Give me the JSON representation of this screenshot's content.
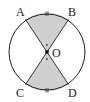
{
  "diagram": {
    "type": "circle-geometry",
    "center": {
      "label": "O"
    },
    "points": [
      {
        "label": "A",
        "position": "upper-left"
      },
      {
        "label": "B",
        "position": "upper-right"
      },
      {
        "label": "C",
        "position": "lower-left"
      },
      {
        "label": "D",
        "position": "lower-right"
      }
    ],
    "segments": [
      "AD",
      "BC"
    ],
    "shaded_sectors": [
      "AOB",
      "COD"
    ],
    "equal_arc_marks": [
      "AB",
      "CD"
    ],
    "equal_angle_marks": [
      "AOB",
      "COD"
    ],
    "colors": {
      "shade": "#cfcfcf",
      "stroke": "#222222",
      "background": "#ffffff"
    }
  }
}
